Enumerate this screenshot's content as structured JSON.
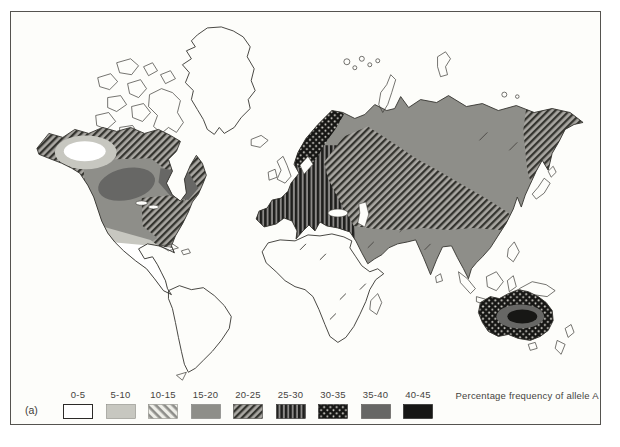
{
  "figure": {
    "caption_label": "(a)",
    "legend_title": "Percentage frequency of allele A"
  },
  "legend": {
    "items": [
      {
        "label": "0-5",
        "pattern": "solid",
        "color": "#ffffff"
      },
      {
        "label": "5-10",
        "pattern": "solid",
        "color": "#c7c7c0"
      },
      {
        "label": "10-15",
        "pattern": "diagonal-back",
        "color": "#8d8d89"
      },
      {
        "label": "15-20",
        "pattern": "solid",
        "color": "#8e8e89"
      },
      {
        "label": "20-25",
        "pattern": "diagonal-forward",
        "color": "#34342f"
      },
      {
        "label": "25-30",
        "pattern": "vertical-lines",
        "color": "#1e1e1c"
      },
      {
        "label": "30-35",
        "pattern": "crosshatch",
        "color": "#161614"
      },
      {
        "label": "35-40",
        "pattern": "solid",
        "color": "#676765"
      },
      {
        "label": "40-45",
        "pattern": "solid",
        "color": "#171715"
      }
    ]
  },
  "map": {
    "regions": [
      {
        "id": "greenland",
        "bucket": "25-30"
      },
      {
        "id": "canadian-arctic",
        "bucket": "25-30"
      },
      {
        "id": "north-america",
        "bucket": "20-25"
      },
      {
        "id": "us-interior",
        "bucket": "15-20"
      },
      {
        "id": "us-east",
        "bucket": "20-25"
      },
      {
        "id": "quebec-labrador-high",
        "bucket": "35-40"
      },
      {
        "id": "central-canada-high",
        "bucket": "35-40"
      },
      {
        "id": "us-south",
        "bucket": "5-10"
      },
      {
        "id": "mexico-central-america",
        "bucket": "0-5"
      },
      {
        "id": "nw-canada-ring",
        "bucket": "5-10"
      },
      {
        "id": "nw-canada-low",
        "bucket": "0-5"
      },
      {
        "id": "caribbean",
        "bucket": "0-5"
      },
      {
        "id": "south-america",
        "bucket": "0-5"
      },
      {
        "id": "tierra-del-fuego",
        "bucket": "0-5"
      },
      {
        "id": "iceland",
        "bucket": "15-20"
      },
      {
        "id": "uk-ireland",
        "bucket": "25-30"
      },
      {
        "id": "eurasia",
        "bucket": "15-20"
      },
      {
        "id": "europe",
        "bucket": "25-30"
      },
      {
        "id": "scandinavia",
        "bucket": "30-35"
      },
      {
        "id": "west-central-russia",
        "bucket": "20-25"
      },
      {
        "id": "northeast-asia",
        "bucket": "20-25"
      },
      {
        "id": "africa",
        "bucket": "15-20"
      },
      {
        "id": "madagascar",
        "bucket": "15-20"
      },
      {
        "id": "sri-lanka",
        "bucket": "15-20"
      },
      {
        "id": "indonesia",
        "bucket": "15-20"
      },
      {
        "id": "philippines",
        "bucket": "15-20"
      },
      {
        "id": "new-guinea",
        "bucket": "20-25"
      },
      {
        "id": "japan",
        "bucket": "20-25"
      },
      {
        "id": "australia",
        "bucket": "30-35"
      },
      {
        "id": "australia-inner",
        "bucket": "35-40"
      },
      {
        "id": "australia-center",
        "bucket": "40-45"
      },
      {
        "id": "tasmania",
        "bucket": "40-45"
      },
      {
        "id": "new-zealand",
        "bucket": "40-45"
      },
      {
        "id": "arctic-islets",
        "bucket": "0-5"
      },
      {
        "id": "novaya-zemlya",
        "bucket": "0-5"
      },
      {
        "id": "severnaya-zemlya",
        "bucket": "0-5"
      }
    ]
  }
}
